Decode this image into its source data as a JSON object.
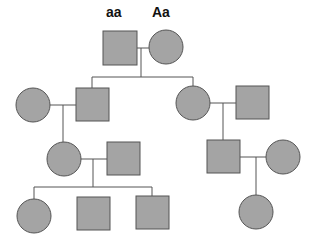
{
  "diagram": {
    "type": "pedigree",
    "colors": {
      "fill": "#a4a4a4",
      "stroke": "#555555",
      "line": "#555555"
    },
    "genotype_labels": [
      {
        "text": "aa",
        "x": 106,
        "y": 4
      },
      {
        "text": "Aa",
        "x": 152,
        "y": 4
      }
    ],
    "individuals": [
      {
        "id": "I-1",
        "sex": "male",
        "shape": "square",
        "x": 103,
        "y": 31,
        "size": 34,
        "affected": true,
        "genotype": "aa"
      },
      {
        "id": "I-2",
        "sex": "female",
        "shape": "circle",
        "cx": 166,
        "cy": 47,
        "r": 17,
        "affected": true,
        "genotype": "Aa"
      },
      {
        "id": "II-1",
        "sex": "female",
        "shape": "circle",
        "cx": 33,
        "cy": 105,
        "r": 17,
        "affected": true
      },
      {
        "id": "II-2",
        "sex": "male",
        "shape": "square",
        "x": 76,
        "y": 88,
        "size": 33,
        "affected": true
      },
      {
        "id": "II-3",
        "sex": "female",
        "shape": "circle",
        "cx": 193,
        "cy": 103,
        "r": 17,
        "affected": true
      },
      {
        "id": "II-4",
        "sex": "male",
        "shape": "square",
        "x": 236,
        "y": 86,
        "size": 33,
        "affected": true
      },
      {
        "id": "III-1",
        "sex": "female",
        "shape": "circle",
        "cx": 64,
        "cy": 159,
        "r": 17,
        "affected": true
      },
      {
        "id": "III-2",
        "sex": "male",
        "shape": "square",
        "x": 107,
        "y": 142,
        "size": 33,
        "affected": true
      },
      {
        "id": "III-3",
        "sex": "male",
        "shape": "square",
        "x": 207,
        "y": 140,
        "size": 33,
        "affected": true
      },
      {
        "id": "III-4",
        "sex": "female",
        "shape": "circle",
        "cx": 283,
        "cy": 157,
        "r": 17,
        "affected": true
      },
      {
        "id": "IV-1",
        "sex": "female",
        "shape": "circle",
        "cx": 34,
        "cy": 216,
        "r": 17,
        "affected": true
      },
      {
        "id": "IV-2",
        "sex": "male",
        "shape": "square",
        "x": 77,
        "y": 197,
        "size": 33,
        "affected": true
      },
      {
        "id": "IV-3",
        "sex": "male",
        "shape": "square",
        "x": 136,
        "y": 196,
        "size": 33,
        "affected": true
      },
      {
        "id": "IV-4",
        "sex": "female",
        "shape": "circle",
        "cx": 256,
        "cy": 212,
        "r": 17,
        "affected": true
      }
    ],
    "lines": [
      {
        "name": "mating-I",
        "x1": 137,
        "y1": 48,
        "x2": 149,
        "y2": 48
      },
      {
        "name": "descent-I",
        "x1": 141,
        "y1": 48,
        "x2": 141,
        "y2": 77
      },
      {
        "name": "sibship-II",
        "x1": 92,
        "y1": 77,
        "x2": 193,
        "y2": 77
      },
      {
        "name": "drop-II-2",
        "x1": 92,
        "y1": 77,
        "x2": 92,
        "y2": 88
      },
      {
        "name": "drop-II-3",
        "x1": 193,
        "y1": 77,
        "x2": 193,
        "y2": 86
      },
      {
        "name": "mating-II-left",
        "x1": 50,
        "y1": 105,
        "x2": 76,
        "y2": 105
      },
      {
        "name": "descent-II-left",
        "x1": 63,
        "y1": 105,
        "x2": 63,
        "y2": 142
      },
      {
        "name": "mating-II-right",
        "x1": 210,
        "y1": 103,
        "x2": 236,
        "y2": 103
      },
      {
        "name": "descent-II-right",
        "x1": 223,
        "y1": 103,
        "x2": 223,
        "y2": 140
      },
      {
        "name": "mating-III-left",
        "x1": 81,
        "y1": 159,
        "x2": 107,
        "y2": 159
      },
      {
        "name": "descent-III-left",
        "x1": 93,
        "y1": 159,
        "x2": 93,
        "y2": 187
      },
      {
        "name": "sibship-IV-left",
        "x1": 34,
        "y1": 187,
        "x2": 152,
        "y2": 187
      },
      {
        "name": "drop-IV-1",
        "x1": 34,
        "y1": 187,
        "x2": 34,
        "y2": 199
      },
      {
        "name": "drop-IV-3",
        "x1": 152,
        "y1": 187,
        "x2": 152,
        "y2": 196
      },
      {
        "name": "mating-III-right",
        "x1": 240,
        "y1": 157,
        "x2": 266,
        "y2": 157
      },
      {
        "name": "descent-III-right",
        "x1": 256,
        "y1": 157,
        "x2": 256,
        "y2": 195
      }
    ]
  }
}
